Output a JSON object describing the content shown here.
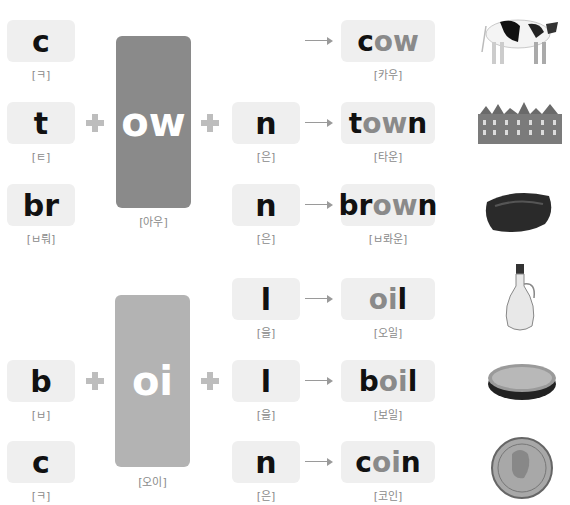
{
  "colors": {
    "ow_box": "#8a8a8a",
    "oi_box": "#b3b3b3",
    "box_bg": "#efefef",
    "highlight": "#8a8a8a"
  },
  "ow_group": {
    "vowel": "ow",
    "vowel_pron": "[아우]",
    "rows": [
      {
        "onset": "c",
        "onset_pron": "[ㅋ]",
        "coda": "",
        "coda_pron": "",
        "word_pre": "c",
        "word_hl": "ow",
        "word_post": "",
        "word_pron": "[카우]",
        "image": "cow-image"
      },
      {
        "onset": "t",
        "onset_pron": "[ㅌ]",
        "coda": "n",
        "coda_pron": "[은]",
        "word_pre": "t",
        "word_hl": "ow",
        "word_post": "n",
        "word_pron": "[타운]",
        "image": "town-image"
      },
      {
        "onset": "br",
        "onset_pron": "[ㅂ뤄]",
        "coda": "n",
        "coda_pron": "[은]",
        "word_pre": "br",
        "word_hl": "ow",
        "word_post": "n",
        "word_pron": "[ㅂ롸운]",
        "image": "brown-paint-image"
      }
    ]
  },
  "oi_group": {
    "vowel": "oi",
    "vowel_pron": "[오이]",
    "rows": [
      {
        "onset": "",
        "onset_pron": "",
        "coda": "l",
        "coda_pron": "[을]",
        "word_pre": "",
        "word_hl": "oi",
        "word_post": "l",
        "word_pron": "[오일]",
        "image": "oil-bottle-image"
      },
      {
        "onset": "b",
        "onset_pron": "[ㅂ]",
        "coda": "l",
        "coda_pron": "[을]",
        "word_pre": "b",
        "word_hl": "oi",
        "word_post": "l",
        "word_pron": "[보일]",
        "image": "boiling-pot-image"
      },
      {
        "onset": "c",
        "onset_pron": "[ㅋ]",
        "coda": "n",
        "coda_pron": "[은]",
        "word_pre": "c",
        "word_hl": "oi",
        "word_post": "n",
        "word_pron": "[코인]",
        "image": "coin-image"
      }
    ]
  }
}
